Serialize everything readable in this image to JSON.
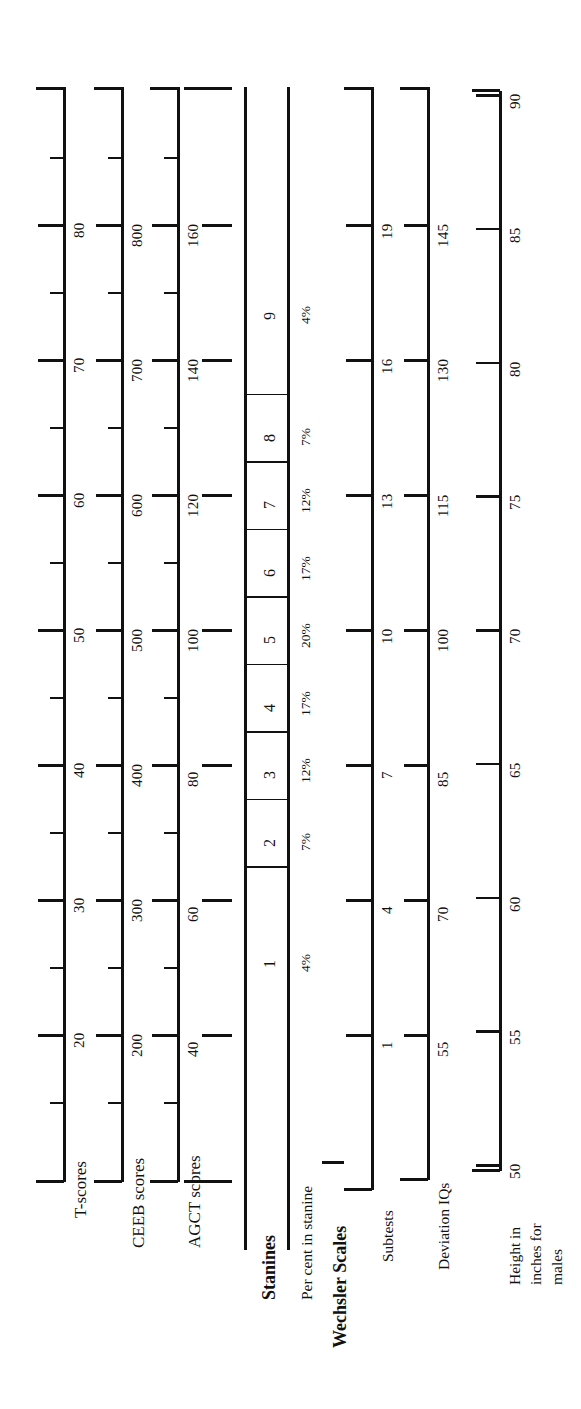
{
  "figure": {
    "orientation": "rotated-90",
    "ink_color": "#111111",
    "background": "#ffffff"
  },
  "chart_data": {
    "type": "table",
    "xlabel": "",
    "ylabel": "",
    "grid": false,
    "legend": "none",
    "common_axis": "z / standard deviation units, range -3 to +3",
    "scales": [
      {
        "name": "T-scores",
        "label": "T-scores",
        "bold": false,
        "ticks": [
          20,
          30,
          40,
          50,
          60,
          70,
          80
        ],
        "tick_labels": [
          "20",
          "30",
          "40",
          "50",
          "60",
          "70",
          "80"
        ],
        "minor_ticks": [
          15,
          25,
          35,
          45,
          55,
          65,
          75,
          85
        ],
        "axis_range": [
          15,
          85
        ]
      },
      {
        "name": "CEEB scores",
        "label": "CEEB scores",
        "bold": false,
        "ticks": [
          200,
          300,
          400,
          500,
          600,
          700,
          800
        ],
        "tick_labels": [
          "200",
          "300",
          "400",
          "500",
          "600",
          "700",
          "800"
        ],
        "minor_ticks": [
          150,
          250,
          350,
          450,
          550,
          650,
          750,
          850
        ],
        "axis_range": [
          150,
          850
        ]
      },
      {
        "name": "AGCT scores",
        "label": "AGCT scores",
        "bold": false,
        "ticks": [
          40,
          60,
          80,
          100,
          120,
          140,
          160
        ],
        "tick_labels": [
          "40",
          "60",
          "80",
          "100",
          "120",
          "140",
          "160"
        ],
        "minor_ticks": [
          30,
          50,
          70,
          90,
          110,
          130,
          150,
          170
        ],
        "axis_range": [
          30,
          170
        ]
      },
      {
        "name": "Stanines",
        "label": "Stanines",
        "bold": true,
        "values": [
          1,
          2,
          3,
          4,
          5,
          6,
          7,
          8,
          9
        ],
        "tick_labels": [
          "1",
          "2",
          "3",
          "4",
          "5",
          "6",
          "7",
          "8",
          "9"
        ],
        "widths_in_sd": [
          0.75,
          0.5,
          0.5,
          0.5,
          0.5,
          0.5,
          0.5,
          0.5,
          0.75
        ]
      },
      {
        "name": "Per cent in stanine",
        "label": "Per cent in stanine",
        "bold": false,
        "values": [
          4,
          7,
          12,
          17,
          20,
          17,
          12,
          7,
          4
        ],
        "tick_labels": [
          "4%",
          "7%",
          "12%",
          "17%",
          "20%",
          "17%",
          "12%",
          "7%",
          "4%"
        ]
      },
      {
        "name": "Wechsler Scales",
        "label": "Wechsler Scales",
        "bold": true,
        "is_group_heading": true
      },
      {
        "name": "Subtests",
        "label": "Subtests",
        "bold": false,
        "ticks": [
          1,
          4,
          7,
          10,
          13,
          16,
          19
        ],
        "tick_labels": [
          "1",
          "4",
          "7",
          "10",
          "13",
          "16",
          "19"
        ],
        "axis_range": [
          1,
          19
        ]
      },
      {
        "name": "Deviation IQs",
        "label": "Deviation IQs",
        "bold": false,
        "ticks": [
          55,
          70,
          85,
          100,
          115,
          130,
          145
        ],
        "tick_labels": [
          "55",
          "70",
          "85",
          "100",
          "115",
          "130",
          "145"
        ],
        "axis_range": [
          55,
          145
        ]
      },
      {
        "name": "Height in inches for males",
        "label": "Height in\ninches for\nmales",
        "label_lines": [
          "Height in",
          "inches for",
          "males"
        ],
        "bold": false,
        "ticks": [
          50,
          55,
          60,
          65,
          70,
          75,
          80,
          85,
          90
        ],
        "tick_labels": [
          "50",
          "55",
          "60",
          "65",
          "70",
          "75",
          "80",
          "85",
          "90"
        ],
        "axis_range": [
          50,
          90
        ]
      }
    ]
  }
}
